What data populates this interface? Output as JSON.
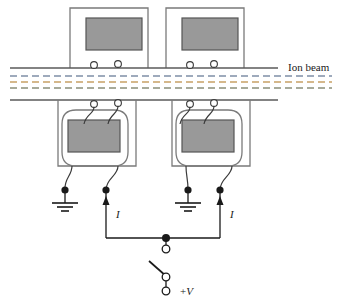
{
  "figure": {
    "type": "ion-optics-deflector-schematic",
    "background_color": "#ffffff",
    "width": 338,
    "height": 306
  },
  "labels": {
    "ion_beam": "Ion beam",
    "current_left": "I",
    "current_right": "I",
    "voltage_plus": "+",
    "voltage_symbol": "V"
  },
  "colors": {
    "electrode_fill": "#999999",
    "electrode_stroke": "#555555",
    "wire": "#1a1a1a",
    "frame": "#7a7a7a",
    "beam_line_1": "#7f8fa6",
    "beam_line_2": "#c8a165",
    "beam_line_3": "#8a8f7a"
  },
  "beam": {
    "line_count": 3,
    "style": "dashed",
    "x_start": 10,
    "x_end": 332,
    "y_positions": [
      76,
      82,
      88
    ]
  },
  "assemblies": [
    {
      "id": "top-left",
      "position": "top",
      "frame": {
        "x": 70,
        "y": 8,
        "width": 78,
        "height": 60
      },
      "electrode": {
        "x": 86,
        "y": 18,
        "width": 56,
        "height": 32
      },
      "terminals": [
        {
          "cx": 94,
          "cy": 65
        },
        {
          "cx": 118,
          "cy": 64
        }
      ]
    },
    {
      "id": "top-right",
      "position": "top",
      "frame": {
        "x": 166,
        "y": 8,
        "width": 78,
        "height": 60
      },
      "electrode": {
        "x": 182,
        "y": 18,
        "width": 56,
        "height": 32
      },
      "terminals": [
        {
          "cx": 190,
          "cy": 65
        },
        {
          "cx": 214,
          "cy": 64
        }
      ]
    },
    {
      "id": "bottom-left",
      "position": "bottom",
      "frame": {
        "x": 58,
        "y": 104,
        "width": 78,
        "height": 62
      },
      "electrode": {
        "x": 62,
        "y": 122,
        "width": 50,
        "height": 30
      },
      "terminals": [
        {
          "cx": 94,
          "cy": 104
        },
        {
          "cx": 118,
          "cy": 103
        }
      ]
    },
    {
      "id": "bottom-right",
      "position": "bottom",
      "frame": {
        "x": 172,
        "y": 104,
        "width": 78,
        "height": 62
      },
      "electrode": {
        "x": 178,
        "y": 122,
        "width": 50,
        "height": 30
      },
      "terminals": [
        {
          "cx": 190,
          "cy": 104
        },
        {
          "cx": 214,
          "cy": 103
        }
      ]
    }
  ],
  "grounds": [
    {
      "id": "ground-left",
      "x": 65,
      "y": 200
    },
    {
      "id": "ground-right",
      "x": 188,
      "y": 200
    }
  ],
  "current_arrows": [
    {
      "id": "current-arrow-left",
      "x": 106,
      "y_tail": 232,
      "y_head": 196,
      "direction": "up"
    },
    {
      "id": "current-arrow-right",
      "x": 220,
      "y_tail": 232,
      "y_head": 196,
      "direction": "up"
    }
  ],
  "switch": {
    "junction_dot": {
      "cx": 166,
      "cy": 238
    },
    "upper_terminal": {
      "cx": 166,
      "cy": 249
    },
    "pivot": {
      "cx": 166,
      "cy": 277
    },
    "lower_terminal": {
      "cx": 166,
      "cy": 291
    },
    "blade": {
      "x1": 149,
      "y1": 261,
      "x2": 166,
      "y2": 277
    },
    "state": "open"
  },
  "horizontal_rails": [
    {
      "id": "upper-rail",
      "x1": 10,
      "x2": 278,
      "y": 68
    },
    {
      "id": "lower-rail",
      "x1": 10,
      "x2": 278,
      "y": 100
    }
  ]
}
